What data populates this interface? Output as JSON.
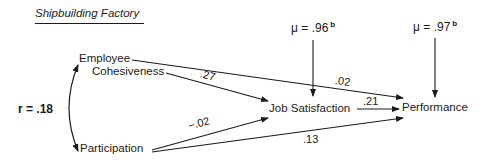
{
  "title": "Shipbuilding Factory",
  "residuals": [
    {
      "symbol": "μ",
      "equals": "=",
      "value": ".96",
      "superscript": "b",
      "target": "Job Satisfaction"
    },
    {
      "symbol": "μ",
      "equals": "=",
      "value": ".97",
      "superscript": "b",
      "target": "Performance"
    }
  ],
  "nodes": {
    "employee_cohesiveness": {
      "line1": "Employee",
      "line2": "Cohesiveness"
    },
    "participation": "Participation",
    "job_satisfaction": "Job Satisfaction",
    "performance": "Performance"
  },
  "correlation": {
    "label": "r = .18",
    "between": [
      "Employee Cohesiveness",
      "Participation"
    ]
  },
  "paths": [
    {
      "from": "Employee Cohesiveness",
      "to": "Job Satisfaction",
      "coefficient": ".27"
    },
    {
      "from": "Employee Cohesiveness",
      "to": "Performance",
      "coefficient": ".02"
    },
    {
      "from": "Job Satisfaction",
      "to": "Performance",
      "coefficient": ".21"
    },
    {
      "from": "Participation",
      "to": "Job Satisfaction",
      "coefficient": "−.02"
    },
    {
      "from": "Participation",
      "to": "Performance",
      "coefficient": ".13"
    }
  ],
  "colors": {
    "ink": "#1a1a1a",
    "background": "#ffffff"
  }
}
